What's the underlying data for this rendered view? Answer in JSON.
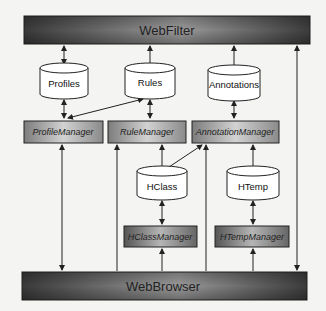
{
  "diagram": {
    "top_bar": {
      "label": "WebFilter"
    },
    "bottom_bar": {
      "label": "WebBrowser"
    },
    "stores": [
      {
        "id": "profiles",
        "label": "Profiles"
      },
      {
        "id": "rules",
        "label": "Rules"
      },
      {
        "id": "annotations",
        "label": "Annotations"
      },
      {
        "id": "hclass",
        "label": "HClass"
      },
      {
        "id": "htemp",
        "label": "HTemp"
      }
    ],
    "managers": [
      {
        "id": "profile_manager",
        "label": "ProfileManager"
      },
      {
        "id": "rule_manager",
        "label": "RuleManager"
      },
      {
        "id": "annotation_manager",
        "label": "AnnotationManager"
      },
      {
        "id": "hclass_manager",
        "label": "HClassManager"
      },
      {
        "id": "htemp_manager",
        "label": "HTempManager"
      }
    ],
    "connections": [
      {
        "from": "WebFilter",
        "to": "Profiles",
        "type": "bidirectional"
      },
      {
        "from": "WebFilter",
        "to": "Rules",
        "type": "bidirectional"
      },
      {
        "from": "WebFilter",
        "to": "Annotations",
        "type": "bidirectional"
      },
      {
        "from": "WebBrowser",
        "to": "WebFilter",
        "type": "bidirectional"
      },
      {
        "from": "Profiles",
        "to": "ProfileManager",
        "type": "bidirectional"
      },
      {
        "from": "Rules",
        "to": "RuleManager",
        "type": "bidirectional"
      },
      {
        "from": "Annotations",
        "to": "AnnotationManager",
        "type": "bidirectional"
      },
      {
        "from": "ProfileManager",
        "to": "Rules",
        "type": "bidirectional"
      },
      {
        "from": "HClass",
        "to": "AnnotationManager",
        "type": "directed"
      },
      {
        "from": "HClass",
        "to": "RuleManager",
        "type": "directed"
      },
      {
        "from": "HClass",
        "to": "HClassManager",
        "type": "bidirectional"
      },
      {
        "from": "HTemp",
        "to": "AnnotationManager",
        "type": "directed"
      },
      {
        "from": "HTemp",
        "to": "HTempManager",
        "type": "bidirectional"
      },
      {
        "from": "WebBrowser",
        "to": "ProfileManager",
        "type": "bidirectional"
      },
      {
        "from": "WebBrowser",
        "to": "RuleManager",
        "type": "directed"
      },
      {
        "from": "WebBrowser",
        "to": "AnnotationManager",
        "type": "directed"
      },
      {
        "from": "WebBrowser",
        "to": "HClassManager",
        "type": "directed"
      },
      {
        "from": "WebBrowser",
        "to": "HTempManager",
        "type": "directed"
      }
    ]
  }
}
